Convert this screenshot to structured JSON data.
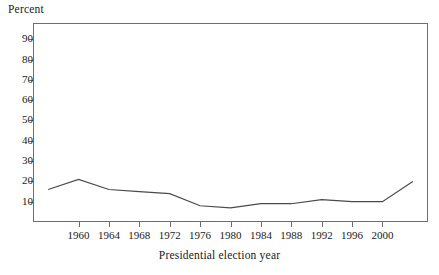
{
  "chart_data": {
    "type": "line",
    "title": "",
    "xlabel": "Presidential election year",
    "ylabel": "Percent",
    "x": [
      1956,
      1960,
      1964,
      1968,
      1972,
      1976,
      1980,
      1984,
      1988,
      1992,
      1996,
      2000,
      2004
    ],
    "values": [
      16,
      21,
      16,
      15,
      14,
      8,
      7,
      9,
      9,
      11,
      10,
      10,
      20
    ],
    "series": [
      {
        "name": "Percent",
        "values": [
          16,
          21,
          16,
          15,
          14,
          8,
          7,
          9,
          9,
          11,
          10,
          10,
          20
        ]
      }
    ],
    "xlim": [
      1954,
      2006
    ],
    "ylim": [
      0,
      98
    ],
    "xticks": [
      1960,
      1964,
      1968,
      1972,
      1976,
      1980,
      1984,
      1988,
      1992,
      1996,
      2000
    ],
    "xticklabels": [
      "1960",
      "1964",
      "1968",
      "1972",
      "1976",
      "1980",
      "1984",
      "1988",
      "1992",
      "1996",
      "2000"
    ],
    "yticks": [
      10,
      20,
      30,
      40,
      50,
      60,
      70,
      80,
      90
    ],
    "yticklabels": [
      "10",
      "20",
      "30",
      "40",
      "50",
      "60",
      "70",
      "80",
      "90"
    ],
    "grid": false,
    "legend": false,
    "legend_position": "none",
    "line_color": "#4a4a4a",
    "frame_color": "#6e6e6e",
    "background": "#ffffff"
  },
  "axes": {
    "y_title": "Percent",
    "x_title": "Presidential election year"
  }
}
